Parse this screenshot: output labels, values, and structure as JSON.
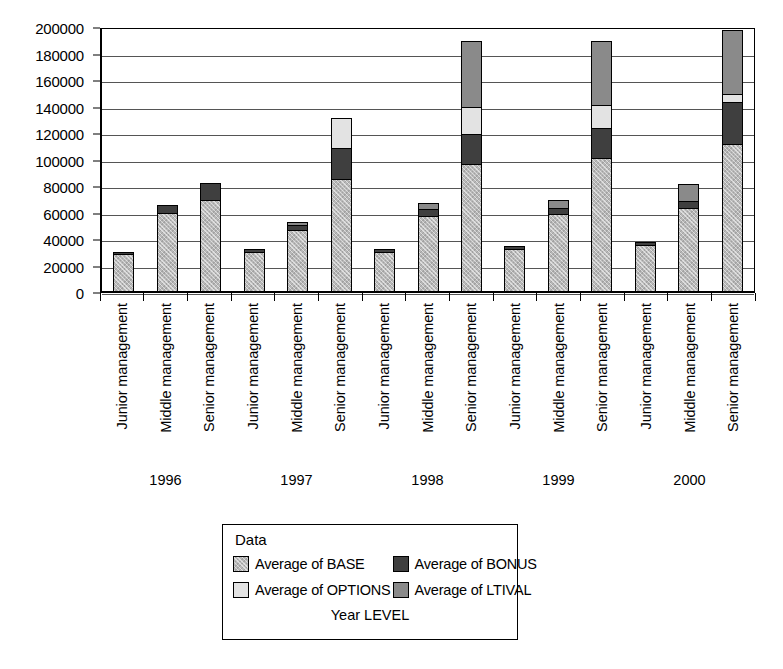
{
  "chart_data": {
    "type": "bar",
    "subtype": "stacked",
    "title": "",
    "xlabel": "Year LEVEL",
    "ylabel": "",
    "ylim": [
      0,
      200000
    ],
    "ytick_step": 20000,
    "yticks": [
      "200000",
      "180000",
      "160000",
      "140000",
      "120000",
      "100000",
      "80000",
      "60000",
      "40000",
      "20000",
      "0"
    ],
    "grid": true,
    "legend_position": "bottom",
    "legend_title": "Data",
    "groups": [
      "1996",
      "1997",
      "1998",
      "1999",
      "2000"
    ],
    "levels": [
      "Junior management",
      "Middle management",
      "Senior management"
    ],
    "categories": [
      "Junior management",
      "Middle management",
      "Senior management",
      "Junior management",
      "Middle management",
      "Senior management",
      "Junior management",
      "Middle management",
      "Senior management",
      "Junior management",
      "Middle management",
      "Senior management",
      "Junior management",
      "Middle management",
      "Senior management"
    ],
    "series": [
      {
        "name": "Average of BASE",
        "color": "#b8b8b8",
        "values": [
          27000,
          58000,
          68000,
          29000,
          45000,
          84000,
          29000,
          56000,
          95000,
          31000,
          57000,
          100000,
          34000,
          62000,
          110000
        ]
      },
      {
        "name": "Average of BONUS",
        "color": "#3f3f3f",
        "values": [
          1500,
          6000,
          13000,
          2000,
          4000,
          23000,
          2000,
          5000,
          23000,
          2000,
          5000,
          22000,
          2500,
          5000,
          32000
        ]
      },
      {
        "name": "Average of OPTIONS",
        "color": "#e3e3e3",
        "values": [
          0,
          0,
          0,
          0,
          0,
          23000,
          0,
          0,
          20000,
          0,
          0,
          18000,
          0,
          0,
          6000
        ]
      },
      {
        "name": "Average of LTIVAL",
        "color": "#8a8a8a",
        "values": [
          0,
          0,
          0,
          0,
          2500,
          0,
          0,
          5000,
          50000,
          0,
          6000,
          48000,
          0,
          13000,
          48000
        ]
      }
    ],
    "totals": [
      28500,
      64000,
      81000,
      31000,
      51500,
      130000,
      31000,
      66000,
      188000,
      33000,
      68000,
      188000,
      36500,
      80000,
      196000
    ]
  },
  "legend": {
    "title": "Data",
    "footer": "Year LEVEL",
    "items": [
      {
        "label": "Average of BASE",
        "color": "#b8b8b8",
        "swatch_class": "c-base"
      },
      {
        "label": "Average of BONUS",
        "color": "#3f3f3f",
        "swatch_class": "c-bonus"
      },
      {
        "label": "Average of OPTIONS",
        "color": "#e3e3e3",
        "swatch_class": "c-options"
      },
      {
        "label": "Average of LTIVAL",
        "color": "#8a8a8a",
        "swatch_class": "c-ltival"
      }
    ]
  }
}
